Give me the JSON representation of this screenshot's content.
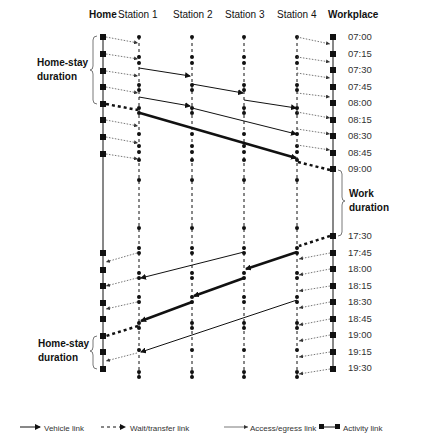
{
  "headers": {
    "home": "Home",
    "station1": "Station 1",
    "station2": "Station 2",
    "station3": "Station 3",
    "station4": "Station 4",
    "workplace": "Workplace"
  },
  "times_morning": [
    "07:00",
    "07:15",
    "07:30",
    "07:45",
    "08:00",
    "08:15",
    "08:30",
    "08:45",
    "09:00"
  ],
  "times_evening": [
    "17:30",
    "17:45",
    "18:00",
    "18:15",
    "18:30",
    "18:45",
    "19:00",
    "19:15",
    "19:30"
  ],
  "labels": {
    "home_stay_top_line1": "Home-stay",
    "home_stay_top_line2": "duration",
    "work_line1": "Work",
    "work_line2": "duration",
    "home_stay_bottom_line1": "Home-stay",
    "home_stay_bottom_line2": "duration"
  },
  "legend": {
    "vehicle": "Vehicle link",
    "wait": "Wait/transfer link",
    "access": "Access/egress link",
    "activity": "Activity link"
  },
  "colors": {
    "line": "#111111",
    "dotted": "#555555"
  }
}
